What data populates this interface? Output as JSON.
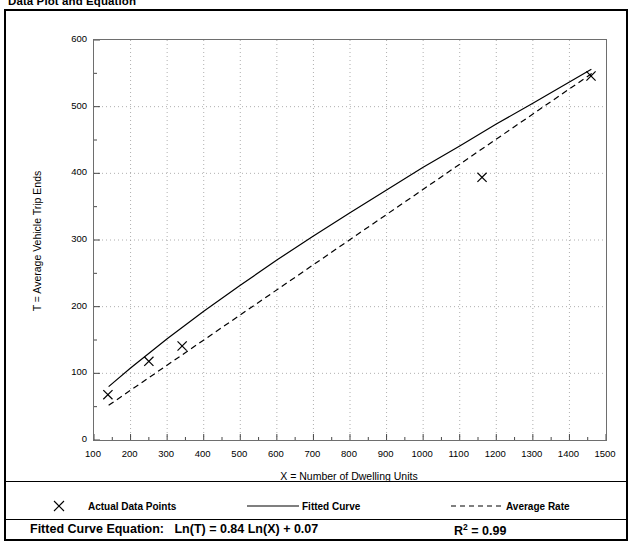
{
  "document": {
    "heading": "Data Plot and Equation"
  },
  "chart_data": {
    "type": "scatter",
    "title": "",
    "xlabel": "X = Number of Dwelling Units",
    "ylabel": "T = Average Vehicle Trip Ends",
    "xlim": [
      100,
      1500
    ],
    "ylim": [
      0,
      600
    ],
    "xticks": [
      100,
      200,
      300,
      400,
      500,
      600,
      700,
      800,
      900,
      1000,
      1100,
      1200,
      1300,
      1400,
      1500
    ],
    "yticks": [
      0,
      100,
      200,
      300,
      400,
      500,
      600
    ],
    "xminor_step": 50,
    "yminor_step": 50,
    "grid": true,
    "grid_style": "dotted",
    "legend_position": "below",
    "series": [
      {
        "name": "Actual Data Points",
        "type": "scatter",
        "marker": "x",
        "color": "#000000",
        "points": [
          {
            "x": 138,
            "y": 68
          },
          {
            "x": 250,
            "y": 118
          },
          {
            "x": 341,
            "y": 141
          },
          {
            "x": 1161,
            "y": 394
          },
          {
            "x": 1459,
            "y": 546
          }
        ]
      },
      {
        "name": "Fitted Curve",
        "type": "line",
        "style": "solid",
        "color": "#000000",
        "equation": "Ln(T) = 0.84 Ln(X) + 0.07",
        "a": 0.07,
        "b": 0.84,
        "points": [
          {
            "x": 140,
            "y": 80
          },
          {
            "x": 200,
            "y": 108
          },
          {
            "x": 300,
            "y": 152
          },
          {
            "x": 400,
            "y": 193
          },
          {
            "x": 500,
            "y": 232
          },
          {
            "x": 600,
            "y": 270
          },
          {
            "x": 700,
            "y": 306
          },
          {
            "x": 800,
            "y": 341
          },
          {
            "x": 900,
            "y": 375
          },
          {
            "x": 1000,
            "y": 409
          },
          {
            "x": 1100,
            "y": 441
          },
          {
            "x": 1200,
            "y": 474
          },
          {
            "x": 1300,
            "y": 505
          },
          {
            "x": 1400,
            "y": 537
          },
          {
            "x": 1460,
            "y": 556
          }
        ]
      },
      {
        "name": "Average Rate",
        "type": "line",
        "style": "dashed",
        "color": "#000000",
        "points": [
          {
            "x": 140,
            "y": 52
          },
          {
            "x": 1470,
            "y": 553
          }
        ]
      }
    ],
    "legend": [
      {
        "label": "Actual Data Points",
        "key": "x-marker"
      },
      {
        "label": "Fitted Curve",
        "key": "solid-line"
      },
      {
        "label": "Average Rate",
        "key": "dashed-line"
      }
    ],
    "annotations": {
      "equation_label": "Fitted Curve Equation:",
      "equation_value": "Ln(T) = 0.84 Ln(X) + 0.07",
      "r_squared_label": "R",
      "r_squared_exponent": "2",
      "r_squared_value": "= 0.99"
    }
  }
}
